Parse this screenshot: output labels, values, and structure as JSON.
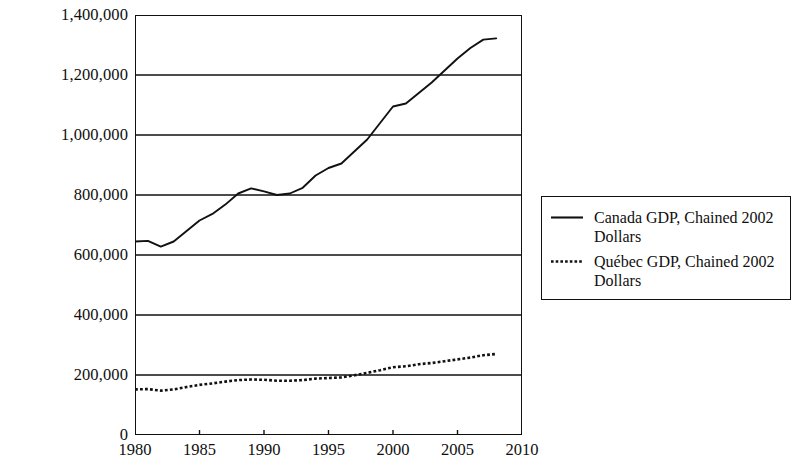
{
  "chart_data": {
    "type": "line",
    "title": "",
    "xlabel": "",
    "ylabel": "",
    "xlim": [
      1980,
      2010
    ],
    "ylim": [
      0,
      1400000
    ],
    "grid": true,
    "legend_position": "right",
    "x_ticks": [
      "1980",
      "1985",
      "1990",
      "1995",
      "2000",
      "2005",
      "2010"
    ],
    "x_tick_values": [
      1980,
      1985,
      1990,
      1995,
      2000,
      2005,
      2010
    ],
    "y_ticks": [
      "0",
      "200,000",
      "400,000",
      "600,000",
      "800,000",
      "1,000,000",
      "1,200,000",
      "1,400,000"
    ],
    "y_tick_values": [
      0,
      200000,
      400000,
      600000,
      800000,
      1000000,
      1200000,
      1400000
    ],
    "x": [
      1980,
      1981,
      1982,
      1983,
      1984,
      1985,
      1986,
      1987,
      1988,
      1989,
      1990,
      1991,
      1992,
      1993,
      1994,
      1995,
      1996,
      1997,
      1998,
      1999,
      2000,
      2001,
      2002,
      2003,
      2004,
      2005,
      2006,
      2007,
      2008
    ],
    "series": [
      {
        "name": "Canada GDP, Chained 2002 Dollars",
        "style": "solid",
        "color": "#111111",
        "values": [
          645000,
          647000,
          628000,
          645000,
          680000,
          715000,
          737000,
          768000,
          805000,
          822000,
          812000,
          800000,
          805000,
          824000,
          865000,
          890000,
          905000,
          945000,
          985000,
          1040000,
          1095000,
          1105000,
          1140000,
          1175000,
          1215000,
          1255000,
          1290000,
          1318000,
          1322000
        ]
      },
      {
        "name": "Québec  GDP, Chained 2002 Dollars",
        "style": "dotted",
        "color": "#111111",
        "values": [
          152000,
          153000,
          148000,
          152000,
          160000,
          167000,
          172000,
          178000,
          183000,
          185000,
          184000,
          181000,
          181000,
          183000,
          188000,
          190000,
          192000,
          199000,
          207000,
          216000,
          226000,
          229000,
          236000,
          240000,
          246000,
          252000,
          258000,
          266000,
          270000
        ]
      }
    ]
  },
  "legend": {
    "entries": [
      {
        "label": "Canada GDP, Chained 2002 Dollars",
        "icon": "solid-line-icon"
      },
      {
        "label": "Québec  GDP, Chained 2002 Dollars",
        "icon": "dotted-line-icon"
      }
    ]
  }
}
